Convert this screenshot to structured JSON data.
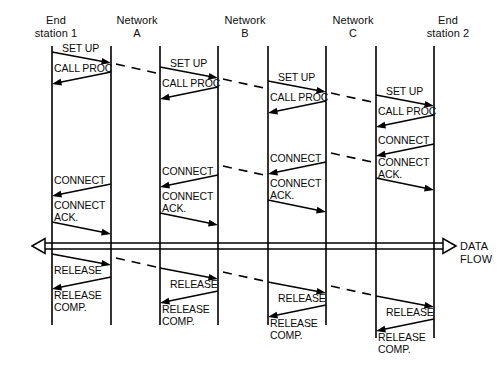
{
  "figure": {
    "kind": "sequence-diagram",
    "title_visible": false,
    "background": "#ffffff",
    "line_color": "#000000",
    "width": 504,
    "height": 369
  },
  "columns": [
    {
      "id": "end-station-1",
      "label": "End\nstation 1",
      "label_x": 21,
      "label_y": 14,
      "label_w": 70
    },
    {
      "id": "network-a",
      "label": "Network\nA",
      "label_x": 102,
      "label_y": 14,
      "label_w": 70
    },
    {
      "id": "network-b",
      "label": "Network\nB",
      "label_x": 210,
      "label_y": 14,
      "label_w": 70
    },
    {
      "id": "network-c",
      "label": "Network\nC",
      "label_x": 318,
      "label_y": 14,
      "label_w": 70
    },
    {
      "id": "end-station-2",
      "label": "End\nstation 2",
      "label_x": 412,
      "label_y": 14,
      "label_w": 72
    }
  ],
  "lifelines": [
    {
      "id": "ll-1",
      "x": 52,
      "y1": 46,
      "y2": 325
    },
    {
      "id": "ll-2",
      "x": 111,
      "y1": 46,
      "y2": 325
    },
    {
      "id": "ll-3",
      "x": 160,
      "y1": 46,
      "y2": 325
    },
    {
      "id": "ll-4",
      "x": 218,
      "y1": 46,
      "y2": 325
    },
    {
      "id": "ll-5",
      "x": 268,
      "y1": 46,
      "y2": 325
    },
    {
      "id": "ll-6",
      "x": 326,
      "y1": 46,
      "y2": 325
    },
    {
      "id": "ll-7",
      "x": 376,
      "y1": 46,
      "y2": 338
    },
    {
      "id": "ll-8",
      "x": 434,
      "y1": 46,
      "y2": 338
    }
  ],
  "messages": [
    {
      "id": "m01",
      "text": "SET UP",
      "dir": "right",
      "x1": 52,
      "y1": 52,
      "x2": 111,
      "y2": 63,
      "lx": 62,
      "ly": 43
    },
    {
      "id": "m02",
      "text": "CALL PROC",
      "dir": "left",
      "x1": 111,
      "y1": 72,
      "x2": 52,
      "y2": 84,
      "lx": 54,
      "ly": 63
    },
    {
      "id": "m03",
      "text": "CONNECT",
      "dir": "left",
      "x1": 111,
      "y1": 184,
      "x2": 52,
      "y2": 196,
      "lx": 54,
      "ly": 175
    },
    {
      "id": "m04",
      "text": "CONNECT\nACK.",
      "dir": "right",
      "x1": 52,
      "y1": 222,
      "x2": 111,
      "y2": 234,
      "lx": 54,
      "ly": 200
    },
    {
      "id": "m05",
      "text": "RELEASE",
      "dir": "right",
      "x1": 52,
      "y1": 254,
      "x2": 111,
      "y2": 265,
      "lx": 54,
      "ly": 265
    },
    {
      "id": "m06",
      "text": "RELEASE\nCOMP.",
      "dir": "left",
      "x1": 111,
      "y1": 277,
      "x2": 52,
      "y2": 289,
      "lx": 54,
      "ly": 290
    },
    {
      "id": "m07",
      "text": "SET UP",
      "dir": "right",
      "x1": 160,
      "y1": 67,
      "x2": 218,
      "y2": 78,
      "lx": 170,
      "ly": 58
    },
    {
      "id": "m08",
      "text": "CALL PROC",
      "dir": "left",
      "x1": 218,
      "y1": 87,
      "x2": 160,
      "y2": 99,
      "lx": 162,
      "ly": 78
    },
    {
      "id": "m09",
      "text": "CONNECT",
      "dir": "left",
      "x1": 218,
      "y1": 175,
      "x2": 160,
      "y2": 187,
      "lx": 162,
      "ly": 166
    },
    {
      "id": "m10",
      "text": "CONNECT\nACK.",
      "dir": "right",
      "x1": 160,
      "y1": 213,
      "x2": 218,
      "y2": 225,
      "lx": 162,
      "ly": 191
    },
    {
      "id": "m11",
      "text": "RELEASE",
      "dir": "right",
      "x1": 160,
      "y1": 268,
      "x2": 218,
      "y2": 279,
      "lx": 170,
      "ly": 279
    },
    {
      "id": "m12",
      "text": "RELEASE\nCOMP.",
      "dir": "left",
      "x1": 218,
      "y1": 291,
      "x2": 160,
      "y2": 303,
      "lx": 162,
      "ly": 304
    },
    {
      "id": "m13",
      "text": "SET UP",
      "dir": "right",
      "x1": 268,
      "y1": 81,
      "x2": 326,
      "y2": 92,
      "lx": 278,
      "ly": 72
    },
    {
      "id": "m14",
      "text": "CALL PROC",
      "dir": "left",
      "x1": 326,
      "y1": 101,
      "x2": 268,
      "y2": 113,
      "lx": 270,
      "ly": 92
    },
    {
      "id": "m15",
      "text": "CONNECT",
      "dir": "left",
      "x1": 326,
      "y1": 162,
      "x2": 268,
      "y2": 174,
      "lx": 270,
      "ly": 153
    },
    {
      "id": "m16",
      "text": "CONNECT\nACK.",
      "dir": "right",
      "x1": 268,
      "y1": 200,
      "x2": 326,
      "y2": 212,
      "lx": 270,
      "ly": 178
    },
    {
      "id": "m17",
      "text": "RELEASE",
      "dir": "right",
      "x1": 268,
      "y1": 282,
      "x2": 326,
      "y2": 293,
      "lx": 278,
      "ly": 293
    },
    {
      "id": "m18",
      "text": "RELEASE\nCOMP.",
      "dir": "left",
      "x1": 326,
      "y1": 305,
      "x2": 268,
      "y2": 317,
      "lx": 270,
      "ly": 318
    },
    {
      "id": "m19",
      "text": "SET UP",
      "dir": "right",
      "x1": 376,
      "y1": 95,
      "x2": 434,
      "y2": 106,
      "lx": 386,
      "ly": 86
    },
    {
      "id": "m20",
      "text": "CALL PROC",
      "dir": "left",
      "x1": 434,
      "y1": 115,
      "x2": 376,
      "y2": 127,
      "lx": 378,
      "ly": 106
    },
    {
      "id": "m21",
      "text": "CONNECT",
      "dir": "left",
      "x1": 434,
      "y1": 144,
      "x2": 376,
      "y2": 156,
      "lx": 378,
      "ly": 135
    },
    {
      "id": "m22",
      "text": "CONNECT\nACK.",
      "dir": "right",
      "x1": 376,
      "y1": 178,
      "x2": 434,
      "y2": 190,
      "lx": 378,
      "ly": 157
    },
    {
      "id": "m23",
      "text": "RELEASE",
      "dir": "right",
      "x1": 376,
      "y1": 296,
      "x2": 434,
      "y2": 307,
      "lx": 386,
      "ly": 307
    },
    {
      "id": "m24",
      "text": "RELEASE\nCOMP.",
      "dir": "left",
      "x1": 434,
      "y1": 319,
      "x2": 376,
      "y2": 331,
      "lx": 378,
      "ly": 332
    }
  ],
  "inter_links": [
    {
      "id": "d01",
      "x1": 116,
      "y1": 64,
      "x2": 156,
      "y2": 73
    },
    {
      "id": "d02",
      "x1": 223,
      "y1": 79,
      "x2": 264,
      "y2": 88
    },
    {
      "id": "d03",
      "x1": 331,
      "y1": 93,
      "x2": 372,
      "y2": 102
    },
    {
      "id": "d04",
      "x1": 223,
      "y1": 166,
      "x2": 264,
      "y2": 175
    },
    {
      "id": "d05",
      "x1": 331,
      "y1": 153,
      "x2": 372,
      "y2": 162
    },
    {
      "id": "d06",
      "x1": 116,
      "y1": 258,
      "x2": 156,
      "y2": 267
    },
    {
      "id": "d07",
      "x1": 223,
      "y1": 272,
      "x2": 264,
      "y2": 281
    },
    {
      "id": "d08",
      "x1": 331,
      "y1": 286,
      "x2": 372,
      "y2": 295
    }
  ],
  "data_flow": {
    "label": "DATA\nFLOW",
    "label_x": 460,
    "label_y": 240,
    "y_top": 243,
    "y_bottom": 249,
    "x_left": 32,
    "x_right": 456,
    "arrow_left": true,
    "arrow_right": true
  }
}
